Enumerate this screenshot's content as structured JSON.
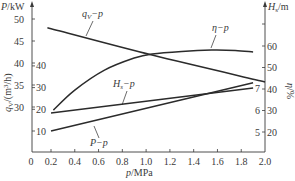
{
  "chart_data": {
    "type": "line",
    "title": "",
    "xlabel": "p/MPa",
    "x_ticks": [
      "0",
      "0.2",
      "0.4",
      "0.6",
      "0.8",
      "1.0",
      "1.2",
      "1.4",
      "1.6",
      "1.8",
      "2.0"
    ],
    "xlim": [
      0,
      2.0
    ],
    "y_axes": [
      {
        "id": "qv",
        "label": "q_V/(m³/h)",
        "side": "left-outer",
        "ticks": [
          30,
          35,
          40,
          45,
          50
        ],
        "ylim": [
          25,
          55
        ]
      },
      {
        "id": "P",
        "label": "P/kW",
        "side": "left-inner",
        "ticks": [
          10,
          20,
          30,
          40
        ],
        "ylim": [
          0,
          50
        ]
      },
      {
        "id": "Hs",
        "label": "H_s/m",
        "side": "right-inner",
        "ticks": [
          5,
          6,
          7
        ],
        "ylim": [
          4,
          9
        ]
      },
      {
        "id": "eta",
        "label": "η/%",
        "side": "right-outer",
        "ticks": [
          20,
          30,
          40,
          50,
          60
        ],
        "ylim": [
          10,
          70
        ]
      }
    ],
    "grid": false,
    "legend": "inline curve labels",
    "series": [
      {
        "name": "q_V–p",
        "axis": "qv",
        "x": [
          0.17,
          1.05,
          2.0
        ],
        "y": [
          48.0,
          41.8,
          35.7
        ]
      },
      {
        "name": "η–p",
        "axis": "eta",
        "x": [
          0.22,
          0.4,
          0.65,
          0.9,
          1.05,
          1.3,
          1.55,
          1.75,
          1.9
        ],
        "y": [
          30.2,
          39.5,
          48.8,
          54.4,
          56.3,
          57.5,
          58.1,
          57.9,
          57.2
        ]
      },
      {
        "name": "H_s–p",
        "axis": "Hs",
        "x": [
          0.2,
          1.9
        ],
        "y": [
          5.86,
          7.0
        ]
      },
      {
        "name": "P–p",
        "axis": "P",
        "x": [
          0.2,
          1.9
        ],
        "y": [
          10.0,
          32.2
        ]
      }
    ]
  },
  "labels": {
    "top_left": "P/kW",
    "left_rotated": "q_V/(m³/h)",
    "top_right": "H_s/m",
    "right_rotated": "η/%",
    "x_axis": "p/MPa",
    "curve_qv": "q_V−p",
    "curve_eta": "η−p",
    "curve_hs": "H_s−p",
    "curve_P": "P−p"
  },
  "tick_labels": {
    "qv": [
      "50",
      "45",
      "40",
      "35",
      "30"
    ],
    "P": [
      "40",
      "30",
      "20",
      "10"
    ],
    "eta": [
      "60",
      "50",
      "40",
      "30",
      "20"
    ],
    "Hs": [
      "7",
      "6",
      "5"
    ],
    "x": [
      "0",
      "0.2",
      "0.4",
      "0.6",
      "0.8",
      "1.0",
      "1.2",
      "1.4",
      "1.6",
      "1.8",
      "2.0"
    ]
  }
}
